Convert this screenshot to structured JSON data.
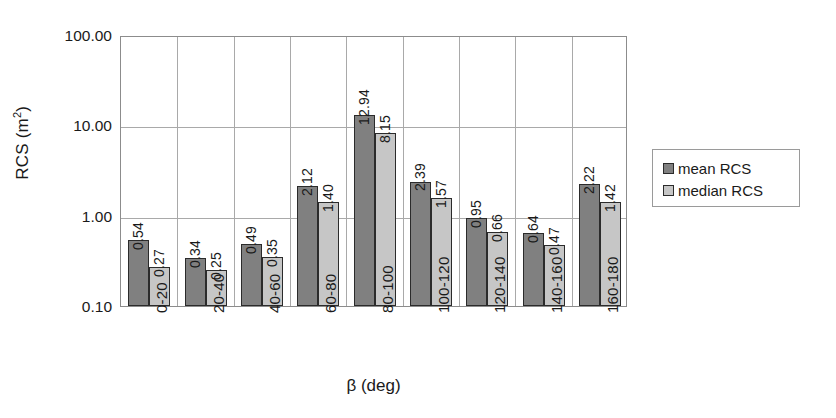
{
  "chart_data": {
    "type": "bar",
    "title": "",
    "xlabel": "β (deg)",
    "ylabel": "RCS (m²)",
    "ylabel_base": "RCS (m",
    "ylabel_sup": "2",
    "ylabel_tail": ")",
    "yscale": "log",
    "ylim": [
      0.1,
      100
    ],
    "ytick_labels": [
      "100.00",
      "10.00",
      "1.00",
      "0.10"
    ],
    "ytick_values": [
      100,
      10,
      1,
      0.1
    ],
    "grid": "horizontal-and-vertical",
    "legend_position": "right",
    "categories": [
      "0-20",
      "20-40",
      "40-60",
      "60-80",
      "80-100",
      "100-120",
      "120-140",
      "140-160",
      "160-180"
    ],
    "series": [
      {
        "name": "mean RCS",
        "color": "#808080",
        "values": [
          0.54,
          0.34,
          0.49,
          2.12,
          12.94,
          2.39,
          0.95,
          0.64,
          2.22
        ],
        "labels": [
          "0.54",
          "0.34",
          "0.49",
          "2.12",
          "12.94",
          "2.39",
          "0.95",
          "0.64",
          "2.22"
        ]
      },
      {
        "name": "median RCS",
        "color": "#c6c6c6",
        "values": [
          0.27,
          0.25,
          0.35,
          1.4,
          8.15,
          1.57,
          0.66,
          0.47,
          1.42
        ],
        "labels": [
          "0.27",
          "0.25",
          "0.35",
          "1.40",
          "8.15",
          "1.57",
          "0.66",
          "0.47",
          "1.42"
        ]
      }
    ]
  },
  "legend": {
    "entries": [
      {
        "label": "mean RCS"
      },
      {
        "label": "median RCS"
      }
    ]
  },
  "axes": {
    "x_title": "β (deg)"
  }
}
